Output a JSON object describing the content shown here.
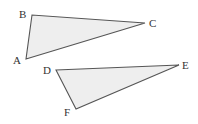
{
  "diagram": {
    "colors": {
      "fill": "#eeeeee",
      "stroke": "#555555",
      "label": "#333333",
      "background": "#ffffff"
    },
    "triangles": [
      {
        "name": "ABC",
        "points": "26,59 32,15 145,23",
        "vertices": [
          {
            "label": "A",
            "x": 26,
            "y": 59,
            "lx": 13,
            "ly": 64
          },
          {
            "label": "B",
            "x": 32,
            "y": 15,
            "lx": 19,
            "ly": 18
          },
          {
            "label": "C",
            "x": 145,
            "y": 23,
            "lx": 149,
            "ly": 27
          }
        ]
      },
      {
        "name": "DEF",
        "points": "56,70 179,65 76,109",
        "vertices": [
          {
            "label": "D",
            "x": 56,
            "y": 70,
            "lx": 43,
            "ly": 74
          },
          {
            "label": "E",
            "x": 179,
            "y": 65,
            "lx": 182,
            "ly": 69
          },
          {
            "label": "F",
            "x": 76,
            "y": 109,
            "lx": 64,
            "ly": 116
          }
        ]
      }
    ]
  }
}
